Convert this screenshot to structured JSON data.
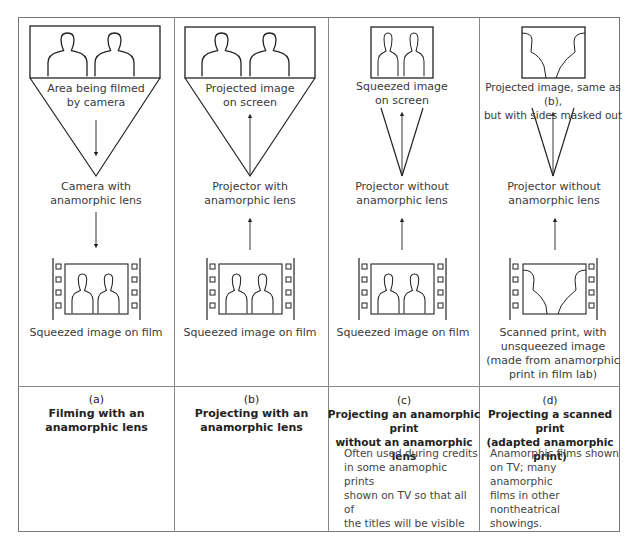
{
  "panels": [
    {
      "id": "a",
      "top_label": "Area being filmed\nby camera",
      "middle_label": "Camera with\nanamorphic lens",
      "bottom_label": "Squeezed image on film",
      "caption_letter": "(a)",
      "caption_title": "Filming with an\nanamorphic lens",
      "note": ""
    },
    {
      "id": "b",
      "top_label": "Projected image\non screen",
      "middle_label": "Projector with\nanamorphic lens",
      "bottom_label": "Squeezed image on film",
      "caption_letter": "(b)",
      "caption_title": "Projecting with an\nanamorphic lens",
      "note": ""
    },
    {
      "id": "c",
      "top_label": "Squeezed image\non screen",
      "middle_label": "Projector without\nanamorphic lens",
      "bottom_label": "Squeezed image on film",
      "caption_letter": "(c)",
      "caption_title": "Projecting an anamorphic print\nwithout an anamorphic lens",
      "note": "Often used during credits\nin some anamophic prints\nshown on TV so that all of\nthe titles will be visible"
    },
    {
      "id": "d",
      "top_label": "Projected image, same as (b),\nbut with sides masked out",
      "middle_label": "Projector without\nanamorphic lens",
      "bottom_label": "Scanned print, with\nunsqueezed image\n(made from anamorphic\nprint in film lab)",
      "caption_letter": "(d)",
      "caption_title": "Projecting a scanned print\n(adapted anamorphic print)",
      "note": "Anamorphic films shown\non TV; many anamorphic\nfilms in other nontheatrical\nshowings."
    }
  ],
  "colors": {
    "line": "#222222",
    "border": "#888888",
    "text": "#3a3a3a"
  }
}
